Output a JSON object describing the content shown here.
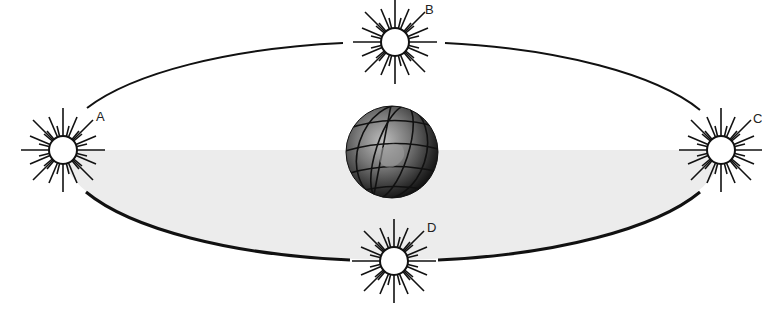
{
  "diagram": {
    "labels": {
      "A": "A",
      "B": "B",
      "C": "C",
      "D": "D"
    },
    "colors": {
      "line": "#111111",
      "shade": "#ececec",
      "background": "#ffffff"
    },
    "orbit": {
      "cx": 392,
      "cy": 152,
      "rx": 330,
      "ry": 110
    },
    "center_body": "Earth globe",
    "sun_positions": [
      {
        "id": "A",
        "x": 63,
        "y": 150
      },
      {
        "id": "B",
        "x": 395,
        "y": 42
      },
      {
        "id": "C",
        "x": 721,
        "y": 150
      },
      {
        "id": "D",
        "x": 394,
        "y": 261
      }
    ]
  }
}
